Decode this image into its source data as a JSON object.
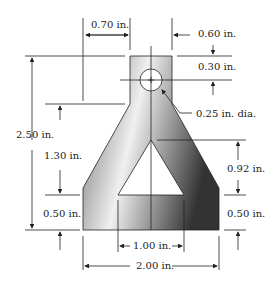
{
  "diagram": {
    "title": "",
    "part_outline_color": "#222222",
    "fill_gradient": [
      "#5a5a5a",
      "#f2f2f2",
      "#3a3a3a"
    ],
    "dimensions": {
      "top_left_offset": "0.70 in.",
      "top_width": "0.60 in.",
      "hole_center_offset": "0.30 in.",
      "hole_diameter": "0.25 in. dia.",
      "overall_height": "2.50 in.",
      "flare_height": "1.30 in.",
      "base_height_left": "0.50 in.",
      "triangle_height": "0.92 in.",
      "base_height_right": "0.50 in.",
      "triangle_base_width": "1.00 in.",
      "overall_width": "2.00 in."
    }
  }
}
